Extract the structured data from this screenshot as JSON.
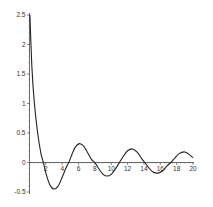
{
  "chart_data": {
    "type": "line",
    "title": "",
    "xlabel": "",
    "ylabel": "",
    "xlim": [
      0,
      20
    ],
    "ylim": [
      -0.5,
      2.5
    ],
    "grid": false,
    "legend": null,
    "x_ticks": [
      2,
      4,
      6,
      8,
      10,
      12,
      14,
      16,
      18,
      20
    ],
    "x_tick_labels": [
      "2",
      "4",
      "6",
      "8",
      "10",
      "12",
      "14",
      "16",
      "18",
      "20"
    ],
    "y_ticks": [
      -0.5,
      0,
      0.5,
      1,
      1.5,
      2,
      2.5
    ],
    "y_tick_labels": [
      "-0.5",
      "0",
      "0.5",
      "1",
      "1.5",
      "2",
      "2.5"
    ],
    "series": [
      {
        "name": "f(x)",
        "color": "#222222",
        "x": [
          0.05,
          0.3,
          0.6,
          1.0,
          1.4,
          1.7,
          2.0,
          2.5,
          3.0,
          3.5,
          4.0,
          4.5,
          4.8,
          5.2,
          5.6,
          6.1,
          6.6,
          7.1,
          7.6,
          8.0,
          8.5,
          9.0,
          9.5,
          10.0,
          10.5,
          11.0,
          11.5,
          12.0,
          12.6,
          13.2,
          13.7,
          14.1,
          14.6,
          15.1,
          15.7,
          16.3,
          16.8,
          17.3,
          17.8,
          18.3,
          18.9,
          19.4,
          20.0
        ],
        "y": [
          2.5,
          1.6,
          1.0,
          0.5,
          0.15,
          0.0,
          -0.18,
          -0.38,
          -0.45,
          -0.4,
          -0.25,
          -0.08,
          0.0,
          0.14,
          0.26,
          0.32,
          0.28,
          0.17,
          0.05,
          0.0,
          -0.11,
          -0.2,
          -0.23,
          -0.2,
          -0.11,
          0.0,
          0.11,
          0.2,
          0.23,
          0.17,
          0.07,
          0.0,
          -0.09,
          -0.16,
          -0.18,
          -0.14,
          -0.06,
          0.0,
          0.08,
          0.15,
          0.18,
          0.15,
          0.08
        ]
      }
    ]
  }
}
